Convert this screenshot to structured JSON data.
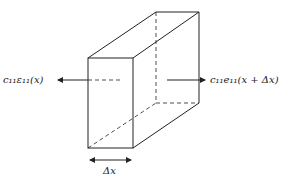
{
  "diagram": {
    "left_label": "c₁₁ε₁₁(x)",
    "right_label": "c₁₁e₁₁(x + Δx)",
    "thickness_label": "Δx",
    "line_color": "#222222"
  }
}
